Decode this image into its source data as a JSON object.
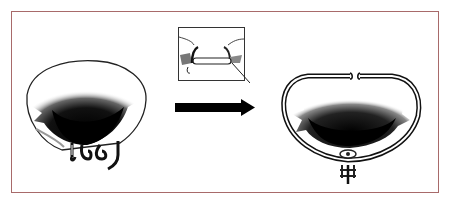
{
  "figure": {
    "type": "surgical-illustration",
    "border_color": "#a86a6a",
    "panels": [
      {
        "id": "before",
        "label": "Valve before repair",
        "icon": "valve-dilated-annulus-icon"
      },
      {
        "id": "inset",
        "label": "Suture detail inset",
        "icon": "suture-detail-icon"
      },
      {
        "id": "arrow",
        "label": "Transition arrow",
        "icon": "arrow-right-icon"
      },
      {
        "id": "after",
        "label": "Valve with annuloplasty ring",
        "icon": "annuloplasty-ring-icon"
      }
    ]
  }
}
